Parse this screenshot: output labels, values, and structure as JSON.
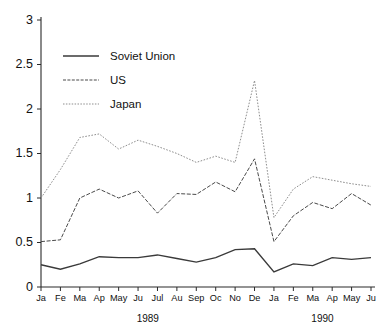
{
  "chart_data": {
    "type": "line",
    "title": "",
    "subtitle": "",
    "xlabel": "",
    "ylabel": "",
    "ylim": [
      0,
      3
    ],
    "ytick_labels": [
      "0",
      "0.5",
      "1",
      "1.5",
      "2",
      "2.5",
      "3"
    ],
    "ytick_values": [
      0,
      0.5,
      1,
      1.5,
      2,
      2.5,
      3
    ],
    "grid": false,
    "legend_position": "top-left-inside",
    "categories": [
      "Ja",
      "Fe",
      "Ma",
      "Ap",
      "May",
      "Ju",
      "Jul",
      "Au",
      "Sep",
      "Oc",
      "No",
      "De",
      "Ja",
      "Fe",
      "Ma",
      "Ap",
      "May",
      "Ju"
    ],
    "group_labels": [
      {
        "label": "1989",
        "from_index": 0,
        "to_index": 11
      },
      {
        "label": "1990",
        "from_index": 12,
        "to_index": 17
      }
    ],
    "series": [
      {
        "name": "Soviet Union",
        "style": "solid",
        "color": "#3a3a3a",
        "values": [
          0.25,
          0.2,
          0.26,
          0.34,
          0.33,
          0.33,
          0.36,
          0.32,
          0.28,
          0.33,
          0.42,
          0.43,
          0.17,
          0.26,
          0.24,
          0.33,
          0.31,
          0.33
        ]
      },
      {
        "name": "US",
        "style": "dashed",
        "color": "#4a4a4a",
        "values": [
          0.51,
          0.53,
          1.0,
          1.1,
          1.0,
          1.08,
          0.83,
          1.05,
          1.04,
          1.18,
          1.07,
          1.44,
          0.51,
          0.8,
          0.95,
          0.88,
          1.05,
          0.92
        ]
      },
      {
        "name": "Japan",
        "style": "dotted",
        "color": "#8e8e8e",
        "values": [
          1.0,
          1.32,
          1.68,
          1.72,
          1.55,
          1.65,
          1.58,
          1.5,
          1.4,
          1.47,
          1.4,
          2.32,
          0.78,
          1.1,
          1.24,
          1.2,
          1.16,
          1.13
        ]
      }
    ]
  },
  "legend": {
    "items": [
      {
        "label": "Soviet Union"
      },
      {
        "label": "US"
      },
      {
        "label": "Japan"
      }
    ]
  }
}
